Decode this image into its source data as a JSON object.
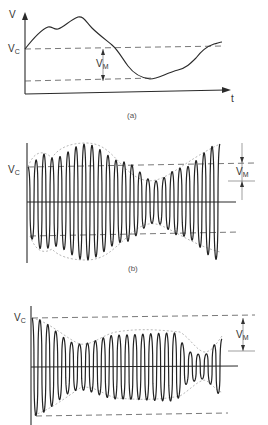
{
  "panel_a": {
    "y_axis_label": "V",
    "x_axis_label": "t",
    "vc_label_main": "V",
    "vc_label_sub": "C",
    "vm_label_main": "V",
    "vm_label_sub": "M",
    "caption": "(a)"
  },
  "panel_b": {
    "vc_label_main": "V",
    "vc_label_sub": "C",
    "vm_label_main": "V",
    "vm_label_sub": "M",
    "caption": "(b)"
  },
  "panel_c": {
    "vc_label_main": "V",
    "vc_label_sub": "C",
    "vm_label_main": "V",
    "vm_label_sub": "M"
  },
  "colors": {
    "line": "#2a2a2a",
    "dash": "#555555",
    "background": "#ffffff"
  }
}
